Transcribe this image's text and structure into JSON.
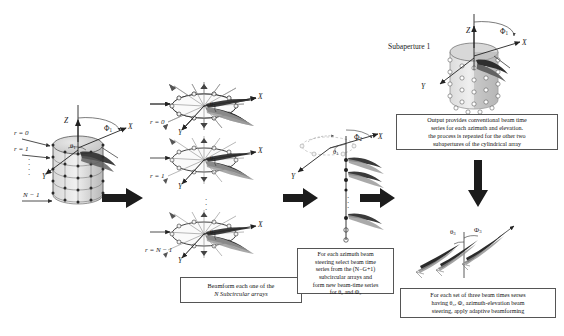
{
  "diagram": {
    "title_hidden": "Cylindrical array subaperture beamforming flow",
    "stages": {
      "stage1": {
        "name": "cylindrical-array",
        "axis_z": "Z",
        "axis_x": "X",
        "axis_y": "Y",
        "angle_phi": "Φ",
        "angle_phi_sub": "1",
        "angle_theta": "θ",
        "angle_theta_sub": "1",
        "ring_labels": [
          "r = 0",
          "r = 1",
          "N − 1"
        ],
        "vdots": "⋮"
      },
      "stage2": {
        "name": "subcircular-arrays",
        "rings": [
          {
            "label": "r = 0",
            "axis_x": "X",
            "axis_y": "Y",
            "angle": "θ",
            "angle_sub": "1"
          },
          {
            "label": "r = 1",
            "axis_x": "X",
            "axis_y": "Y",
            "angle": "θ",
            "angle_sub": "1"
          },
          {
            "label": "r = N − 1",
            "axis_x": "X",
            "axis_y": "Y",
            "angle": "θ",
            "angle_sub": "1"
          }
        ],
        "vdots": "⋮",
        "caption": "Beamform each one of the N Subcircular arrays",
        "caption_line1": "Beamform each one of the",
        "caption_line2": "N Subcircular arrays"
      },
      "stage3": {
        "name": "vertical-beam-array",
        "axis_x": "X",
        "axis_y": "Y",
        "angle_phi": "Φ",
        "angle_phi_sub": "2",
        "angle_theta": "θ",
        "angle_theta_sub": "1",
        "vdots": "⋮",
        "caption_lines": [
          "For each azimuth beam",
          "steering select beam time",
          "series from  the (N−G+1)",
          "subcircular arrays  and",
          "form new beam-time series",
          "for θ₂ and Φ₂"
        ]
      },
      "stage4": {
        "name": "subaperture-cylinder",
        "title": "Subaperture   1",
        "axis_z": "Z",
        "axis_x": "X",
        "axis_y": "Y",
        "angle_phi": "Φ",
        "angle_phi_sub": "1",
        "caption_lines": [
          "Output provides conventional beam time",
          "series for each azimuth and elevation.",
          "the process is repeated for the other two",
          "subapertures  of the cylindrical array"
        ]
      },
      "stage5": {
        "name": "adaptive-beam-triple",
        "angle_theta": "θ",
        "angle_theta_sub": "3",
        "angle_phi": "Φ",
        "angle_phi_sub": "3",
        "caption_lines": [
          "For each set of three beam times serses",
          "having θ₃, Φ₃ azimuth-elevation beam",
          "steering, apply adaptive beamforming"
        ]
      }
    },
    "flow_arrows": [
      "arrow-1",
      "arrow-2",
      "arrow-3",
      "arrow-down"
    ],
    "colors": {
      "ink": "#1a1a1a",
      "beam_dark": "#262626",
      "beam_mid": "#8c8c8c",
      "cylinder_fill": "#c9c9c9",
      "box_border": "#555555"
    }
  }
}
